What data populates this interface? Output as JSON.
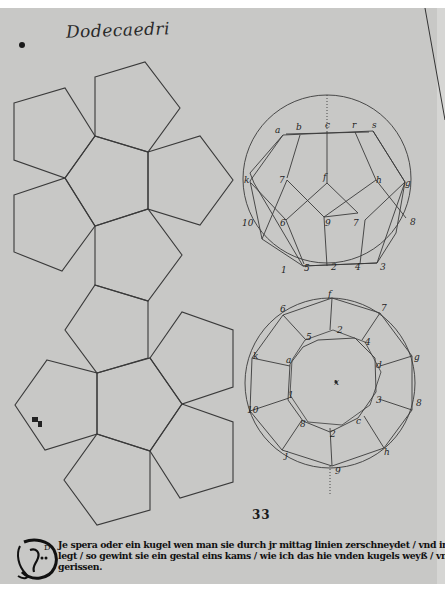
{
  "document": {
    "title": "Dodecaedri",
    "page_number": "33",
    "caption": {
      "initial_letter": "D",
      "lines": [
        "Je spera oder ein kugel wen man sie durch jr mittag linien zerschneydet / vnd in ein planum",
        "legt / so gewint sie ein gestal eins kams / wie ich das hie vnden kugels weyß / vnd offen hab auf=",
        "gerissen."
      ]
    },
    "figures": {
      "net": {
        "name": "Dodecahedron net (12 pentagons)",
        "face_count": 12
      },
      "upper_circle": {
        "labels": [
          "a",
          "b",
          "c",
          "r",
          "s",
          "f",
          "7",
          "h",
          "g",
          "k",
          "10",
          "6",
          "9",
          "7",
          "8",
          "1",
          "5",
          "2",
          "4",
          "3"
        ]
      },
      "lower_circle": {
        "labels": [
          "f",
          "6",
          "7",
          "5",
          "2",
          "4",
          "k",
          "a",
          "g",
          "d",
          "1",
          "3",
          "10",
          "8",
          "c",
          "8",
          "e",
          "2",
          "j",
          "h",
          "9",
          "x"
        ]
      }
    },
    "colors": {
      "paper": "#c8c8c6",
      "ink": "#2a2a2a",
      "margin": "#ffffff"
    }
  }
}
